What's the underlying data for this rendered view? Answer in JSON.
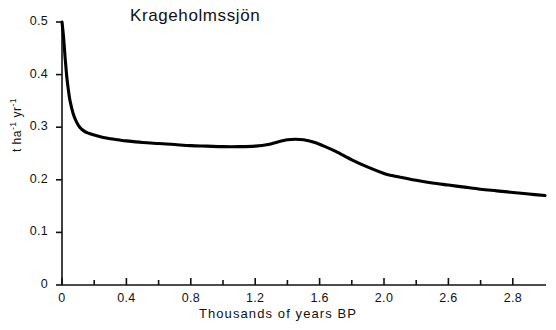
{
  "chart_data": {
    "type": "line",
    "title": "Krageholmssjön",
    "xlabel": "Thousands of years BP",
    "ylabel": "t ha-1 yr-1",
    "ylabel_parts": {
      "unit1": "t ha",
      "exp1": "-1",
      "unit2": "yr",
      "exp2": "-1"
    },
    "xlim": [
      0,
      3.0
    ],
    "ylim": [
      0,
      0.5
    ],
    "grid": false,
    "legend": null,
    "xticks": [
      0,
      0.2,
      0.4,
      0.6,
      0.8,
      1.0,
      1.2,
      1.4,
      1.6,
      1.8,
      2.0,
      2.2,
      2.4,
      2.6,
      2.8
    ],
    "xtick_labels": [
      "0",
      "",
      "0.4",
      "",
      "0.8",
      "",
      "1.2",
      "",
      "1.6",
      "",
      "2.0",
      "",
      "2.6",
      "",
      "2.8"
    ],
    "yticks": [
      0,
      0.1,
      0.2,
      0.3,
      0.4,
      0.5
    ],
    "ytick_labels": [
      "0",
      "0.1",
      "0.2",
      "0.3",
      "0.4",
      "0.5"
    ],
    "series": [
      {
        "name": "sediment accumulation rate",
        "color": "#000000",
        "x": [
          0.0,
          0.01,
          0.02,
          0.03,
          0.04,
          0.05,
          0.07,
          0.09,
          0.11,
          0.14,
          0.17,
          0.2,
          0.25,
          0.3,
          0.35,
          0.4,
          0.5,
          0.6,
          0.7,
          0.8,
          0.9,
          1.0,
          1.1,
          1.2,
          1.28,
          1.34,
          1.4,
          1.45,
          1.5,
          1.56,
          1.62,
          1.7,
          1.8,
          1.9,
          2.0,
          2.05,
          2.1,
          2.2,
          2.3,
          2.4,
          2.5,
          2.6,
          2.7,
          2.8,
          2.9,
          3.0
        ],
        "y": [
          0.5,
          0.47,
          0.43,
          0.395,
          0.37,
          0.35,
          0.325,
          0.31,
          0.3,
          0.292,
          0.288,
          0.285,
          0.281,
          0.278,
          0.276,
          0.274,
          0.271,
          0.269,
          0.267,
          0.265,
          0.264,
          0.263,
          0.263,
          0.264,
          0.267,
          0.272,
          0.276,
          0.277,
          0.276,
          0.272,
          0.265,
          0.254,
          0.238,
          0.224,
          0.212,
          0.208,
          0.205,
          0.199,
          0.194,
          0.19,
          0.186,
          0.182,
          0.179,
          0.176,
          0.173,
          0.17
        ]
      }
    ]
  },
  "axes": {
    "tick_color": "#111111",
    "axis_color": "#111111",
    "line_color": "#000000"
  }
}
